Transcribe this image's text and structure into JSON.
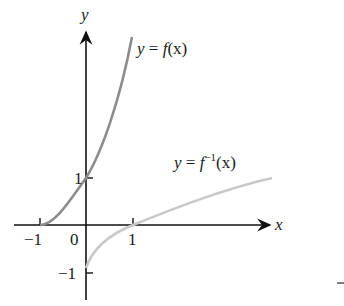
{
  "diagram": {
    "axes": {
      "x_label": "x",
      "y_label": "y"
    },
    "ticks": {
      "x_neg1": "−1",
      "origin": "0",
      "x_1": "1",
      "y_1": "1",
      "y_neg1": "−1"
    },
    "curves": [
      {
        "name": "f",
        "label_prefix": "y = ",
        "func": "f",
        "arg": "(x)",
        "color": "#8c8c8c"
      },
      {
        "name": "f-inverse",
        "label_prefix": "y = ",
        "func": "f",
        "sup": "−1",
        "arg": "(x)",
        "color": "#c8c8c8"
      }
    ],
    "stray_mark": "–"
  }
}
